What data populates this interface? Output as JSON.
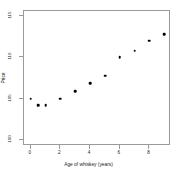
{
  "chart_data": {
    "type": "scatter",
    "title": "",
    "xlabel": "Age of whiskey (years)",
    "ylabel": "Price",
    "x": [
      0,
      0.5,
      1,
      2,
      3,
      4,
      5,
      6,
      7,
      8,
      9
    ],
    "y": [
      105.0,
      104.2,
      104.2,
      105.0,
      105.9,
      106.9,
      107.8,
      110.0,
      110.8,
      112.0,
      112.8
    ],
    "points": [
      {
        "x": 0,
        "y": 105.0
      },
      {
        "x": 0.5,
        "y": 104.2
      },
      {
        "x": 1,
        "y": 104.2
      },
      {
        "x": 2,
        "y": 105.0
      },
      {
        "x": 3,
        "y": 105.9
      },
      {
        "x": 4,
        "y": 106.9
      },
      {
        "x": 5,
        "y": 107.8
      },
      {
        "x": 6,
        "y": 110.0
      },
      {
        "x": 7,
        "y": 110.8
      },
      {
        "x": 8,
        "y": 112.0
      },
      {
        "x": 9,
        "y": 112.8
      }
    ],
    "xlim": [
      -0.45,
      9.45
    ],
    "ylim": [
      99.3,
      115.6
    ],
    "xticks": [
      0,
      2,
      4,
      6,
      8
    ],
    "xtick_labels": [
      "0",
      "2",
      "4",
      "6",
      "8"
    ],
    "yticks": [
      100,
      105,
      110,
      115
    ],
    "ytick_labels": [
      "100",
      "105",
      "110",
      "115"
    ],
    "grid": false,
    "legend": null,
    "marker": "filled-circle",
    "marker_color": "#000000",
    "frame_color": "#9a9a9a",
    "background": "#ffffff"
  }
}
